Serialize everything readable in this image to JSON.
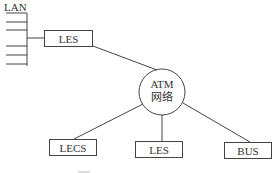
{
  "diagram": {
    "lan_label": "LAN",
    "atm_network": {
      "line1": "ATM",
      "line2": "网络"
    },
    "nodes": {
      "les_top": "LES",
      "lecs": "LECS",
      "les_bottom": "LES",
      "bus": "BUS"
    },
    "caption_fragment": ""
  },
  "colors": {
    "stroke": "#444444",
    "text": "#333333",
    "background": "#ffffff"
  }
}
